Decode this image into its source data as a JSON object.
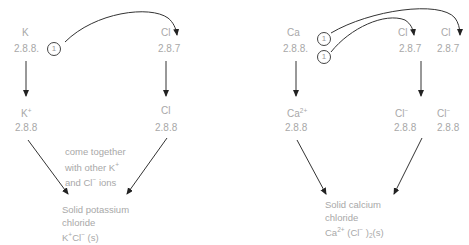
{
  "left_panel": {
    "atom_k": {
      "symbol": "K",
      "config": "2.8.8."
    },
    "atom_cl": {
      "symbol": "Cl",
      "config": "2.8.7"
    },
    "electron_circle": "1",
    "ion_k": {
      "symbol": "K",
      "charge": "+",
      "config": "2.8.8"
    },
    "ion_cl": {
      "symbol": "Cl",
      "charge": "",
      "config": "2.8.8"
    },
    "note_lines": [
      "come together",
      "with other K",
      "and Cl",
      " ions"
    ],
    "note_k_charge": "+",
    "note_cl_charge": "−",
    "product_lines": [
      "Solid potassium",
      "chloride"
    ],
    "product_formula": {
      "k": "K",
      "k_charge": "+",
      "cl": "Cl",
      "cl_charge": "−",
      "state": " (s)"
    }
  },
  "right_panel": {
    "atom_ca": {
      "symbol": "Ca",
      "config": "2.8.8."
    },
    "electron_circles": [
      "1",
      "1"
    ],
    "atom_cl_1": {
      "symbol": "Cl",
      "config": "2.8.7"
    },
    "atom_cl_2": {
      "symbol": "Cl",
      "config": "2.8.7"
    },
    "ion_ca": {
      "symbol": "Ca",
      "charge": "2+",
      "config": "2.8.8"
    },
    "ion_cl_1": {
      "symbol": "Cl",
      "charge": "−",
      "config": "2.8.8"
    },
    "ion_cl_2": {
      "symbol": "Cl",
      "charge": "−",
      "config": "2.8.8"
    },
    "product_lines": [
      "Solid calcium",
      "chloride"
    ],
    "product_formula": {
      "ca": "Ca",
      "ca_charge": "2+",
      "open": " (Cl",
      "cl_charge": "−",
      "close": " )",
      "subscript": "2",
      "state": "(s)"
    }
  },
  "colors": {
    "text": "#a8a8a8",
    "arrow": "#333333"
  }
}
